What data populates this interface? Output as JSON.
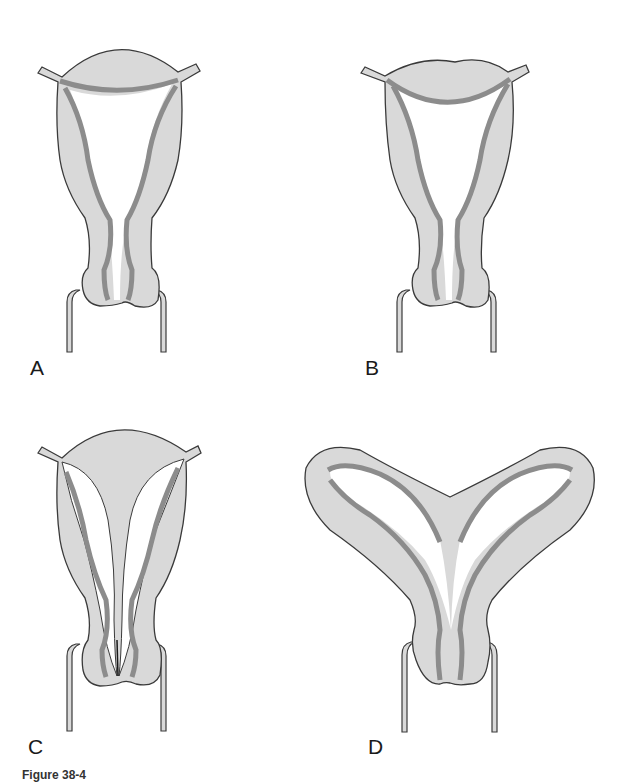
{
  "figure": {
    "panels": [
      {
        "id": "A",
        "label": "A",
        "description": "normal uterus"
      },
      {
        "id": "B",
        "label": "B",
        "description": "arcuate uterus"
      },
      {
        "id": "C",
        "label": "C",
        "description": "septate uterus"
      },
      {
        "id": "D",
        "label": "D",
        "description": "bicornuate uterus"
      }
    ],
    "caption": "Figure 38-4"
  },
  "colors": {
    "outline": "#3a3a3a",
    "wall_fill": "#d9d9d9",
    "endometrium": "#8c8c8c",
    "cavity": "#ffffff",
    "background": "#ffffff"
  }
}
